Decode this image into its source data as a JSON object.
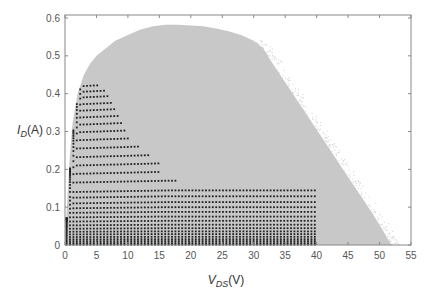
{
  "chart_data": {
    "type": "scatter",
    "title": "",
    "xlabel": "V_DS(V)",
    "xlabel_main": "V",
    "xlabel_sub": "DS",
    "xlabel_unit": "(V)",
    "ylabel": "I_D(A)",
    "ylabel_main": "I",
    "ylabel_sub": "D",
    "ylabel_unit": "(A)",
    "xlim": [
      0,
      55
    ],
    "ylim": [
      0,
      0.6
    ],
    "xticks": [
      0,
      5,
      10,
      15,
      20,
      25,
      30,
      35,
      40,
      45,
      50,
      55
    ],
    "xtick_labels": [
      "0",
      "5",
      "10",
      "15",
      "20",
      "25",
      "30",
      "35",
      "40",
      "45",
      "50",
      "55"
    ],
    "yticks": [
      0,
      0.1,
      0.2,
      0.3,
      0.4,
      0.5,
      0.6
    ],
    "ytick_labels": [
      "0",
      "0.1",
      "0.2",
      "0.3",
      "0.4",
      "0.5",
      "0.6"
    ],
    "grid": false,
    "legend": null,
    "series": [
      {
        "name": "envelope (gray scatter region)",
        "color": "#c8c8c8",
        "kind": "filled-region",
        "boundary": [
          [
            0,
            0
          ],
          [
            0.3,
            0.1
          ],
          [
            0.7,
            0.22
          ],
          [
            1.2,
            0.32
          ],
          [
            2,
            0.4
          ],
          [
            3,
            0.45
          ],
          [
            4,
            0.48
          ],
          [
            5,
            0.5
          ],
          [
            6.5,
            0.52
          ],
          [
            8,
            0.54
          ],
          [
            10,
            0.555
          ],
          [
            12,
            0.57
          ],
          [
            14,
            0.578
          ],
          [
            16,
            0.582
          ],
          [
            18,
            0.582
          ],
          [
            20,
            0.58
          ],
          [
            22,
            0.578
          ],
          [
            24,
            0.572
          ],
          [
            26,
            0.565
          ],
          [
            28,
            0.555
          ],
          [
            30,
            0.54
          ],
          [
            31.5,
            0.52
          ],
          [
            33,
            0.48
          ],
          [
            35,
            0.43
          ],
          [
            37,
            0.38
          ],
          [
            39,
            0.33
          ],
          [
            41,
            0.28
          ],
          [
            43,
            0.23
          ],
          [
            45,
            0.18
          ],
          [
            47,
            0.13
          ],
          [
            49,
            0.08
          ],
          [
            50.5,
            0.04
          ],
          [
            51.5,
            0.01
          ],
          [
            52,
            0
          ]
        ]
      },
      {
        "name": "measured I-V curves (black dots)",
        "color": "#222222",
        "kind": "dotted-curves",
        "curves": [
          {
            "isat": 0.42,
            "vend": 5.5
          },
          {
            "isat": 0.405,
            "vend": 6.5
          },
          {
            "isat": 0.39,
            "vend": 7.0
          },
          {
            "isat": 0.372,
            "vend": 7.5
          },
          {
            "isat": 0.355,
            "vend": 8.0
          },
          {
            "isat": 0.337,
            "vend": 8.5
          },
          {
            "isat": 0.318,
            "vend": 9.0
          },
          {
            "isat": 0.298,
            "vend": 9.5
          },
          {
            "isat": 0.277,
            "vend": 10.5
          },
          {
            "isat": 0.255,
            "vend": 12.0
          },
          {
            "isat": 0.232,
            "vend": 13.5
          },
          {
            "isat": 0.21,
            "vend": 15.0
          },
          {
            "isat": 0.188,
            "vend": 15.0
          },
          {
            "isat": 0.165,
            "vend": 18.0
          },
          {
            "isat": 0.14,
            "vend": 40.0
          },
          {
            "isat": 0.125,
            "vend": 40.0
          },
          {
            "isat": 0.11,
            "vend": 40.0
          },
          {
            "isat": 0.097,
            "vend": 40.0
          },
          {
            "isat": 0.085,
            "vend": 40.0
          },
          {
            "isat": 0.073,
            "vend": 40.0
          },
          {
            "isat": 0.062,
            "vend": 40.0
          },
          {
            "isat": 0.052,
            "vend": 40.0
          },
          {
            "isat": 0.043,
            "vend": 40.0
          },
          {
            "isat": 0.035,
            "vend": 40.0
          },
          {
            "isat": 0.028,
            "vend": 40.0
          },
          {
            "isat": 0.021,
            "vend": 40.0
          },
          {
            "isat": 0.015,
            "vend": 40.0
          },
          {
            "isat": 0.01,
            "vend": 40.0
          },
          {
            "isat": 0.005,
            "vend": 40.0
          },
          {
            "isat": 0.001,
            "vend": 40.0
          }
        ],
        "step_notes": "staircase cutoffs observed at approx V=16 (I~0.14), 17.5 (0.125), 22 (0.11), 26 (0.095), 33 (0.08), 40 (<=0.065)"
      }
    ]
  }
}
